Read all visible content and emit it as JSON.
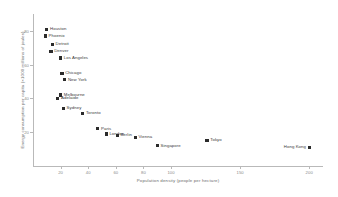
{
  "chart_data": {
    "type": "scatter",
    "title": "",
    "xlabel": "Population density (people per hectare)",
    "ylabel": "Energy consumption per capita (×1000 millions of joules)",
    "xlim": [
      0,
      210
    ],
    "ylim": [
      0,
      90
    ],
    "xticks": [
      20,
      40,
      60,
      80,
      100,
      150,
      200
    ],
    "yticks": [
      20,
      40,
      60,
      80
    ],
    "grid": false,
    "legend": "none",
    "point_label_field": "city",
    "points": [
      {
        "city": "Houston",
        "x": 10,
        "y": 81,
        "label_side": "right"
      },
      {
        "city": "Phoenix",
        "x": 9,
        "y": 77,
        "label_side": "right"
      },
      {
        "city": "Detroit",
        "x": 14,
        "y": 72,
        "label_side": "right"
      },
      {
        "city": "Denver",
        "x": 13,
        "y": 68,
        "label_side": "right"
      },
      {
        "city": "Los Angeles",
        "x": 20,
        "y": 64,
        "label_side": "right"
      },
      {
        "city": "Chicago",
        "x": 21,
        "y": 55,
        "label_side": "right"
      },
      {
        "city": "New York",
        "x": 23,
        "y": 51,
        "label_side": "right"
      },
      {
        "city": "Melbourne",
        "x": 20,
        "y": 42,
        "label_side": "right"
      },
      {
        "city": "Adelaide",
        "x": 18,
        "y": 40,
        "label_side": "right"
      },
      {
        "city": "Sydney",
        "x": 22,
        "y": 34,
        "label_side": "right"
      },
      {
        "city": "Toronto",
        "x": 36,
        "y": 31,
        "label_side": "right"
      },
      {
        "city": "Paris",
        "x": 47,
        "y": 22,
        "label_side": "right"
      },
      {
        "city": "London",
        "x": 53,
        "y": 19,
        "label_side": "right"
      },
      {
        "city": "Berlin",
        "x": 61,
        "y": 18,
        "label_side": "right"
      },
      {
        "city": "Vienna",
        "x": 74,
        "y": 17,
        "label_side": "right"
      },
      {
        "city": "Singapore",
        "x": 90,
        "y": 12,
        "label_side": "right"
      },
      {
        "city": "Tokyo",
        "x": 126,
        "y": 15,
        "label_side": "right"
      },
      {
        "city": "Hong Kong",
        "x": 200,
        "y": 11,
        "label_side": "left"
      }
    ]
  },
  "style": {
    "marker_color": "#2b2b2b",
    "axis_color": "#b9b9b9",
    "label_color": "#3a3a3a",
    "background": "#ffffff"
  }
}
